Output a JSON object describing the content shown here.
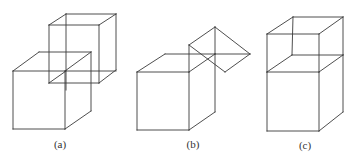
{
  "figure": {
    "stroke_color": "#3a3a3a",
    "panels": [
      {
        "id": "a",
        "label": "(a)",
        "label_pos": [
          60,
          138
        ],
        "description": "Two cubes: a second cube translated diagonally up-right from the first, overlapping",
        "lines": [
          [
            13,
            71,
            65,
            71
          ],
          [
            65,
            71,
            65,
            129
          ],
          [
            65,
            129,
            13,
            129
          ],
          [
            13,
            129,
            13,
            71
          ],
          [
            13,
            71,
            39,
            52
          ],
          [
            39,
            52,
            91,
            52
          ],
          [
            65,
            71,
            91,
            52
          ],
          [
            91,
            52,
            91,
            111
          ],
          [
            65,
            129,
            91,
            111
          ],
          [
            49,
            25,
            99,
            25
          ],
          [
            99,
            25,
            99,
            83
          ],
          [
            99,
            83,
            49,
            83
          ],
          [
            49,
            83,
            49,
            25
          ],
          [
            49,
            25,
            66,
            14
          ],
          [
            66,
            14,
            116,
            14
          ],
          [
            99,
            25,
            116,
            14
          ],
          [
            116,
            14,
            116,
            70
          ],
          [
            99,
            83,
            116,
            70
          ],
          [
            66,
            14,
            66,
            90
          ],
          [
            65,
            71,
            116,
            71
          ],
          [
            49,
            83,
            66,
            71
          ]
        ]
      },
      {
        "id": "b",
        "label": "(b)",
        "label_pos": [
          193,
          138
        ],
        "description": "Cube with a second cube rotated 45° attached at its upper-right edge",
        "lines": [
          [
            137,
            72,
            189,
            72
          ],
          [
            189,
            72,
            189,
            130
          ],
          [
            189,
            130,
            137,
            130
          ],
          [
            137,
            130,
            137,
            72
          ],
          [
            137,
            72,
            165,
            54
          ],
          [
            165,
            54,
            215,
            54
          ],
          [
            189,
            72,
            215,
            54
          ],
          [
            215,
            54,
            215,
            112
          ],
          [
            189,
            130,
            215,
            112
          ],
          [
            215,
            27,
            250,
            54
          ],
          [
            250,
            54,
            225,
            72
          ],
          [
            225,
            72,
            189,
            45
          ],
          [
            189,
            45,
            215,
            27
          ],
          [
            189,
            45,
            189,
            72
          ],
          [
            215,
            27,
            215,
            54
          ],
          [
            215,
            54,
            250,
            54
          ]
        ]
      },
      {
        "id": "c",
        "label": "(c)",
        "label_pos": [
          305,
          139
        ],
        "description": "Two cubes stacked vertically, the second placed directly on top of the first",
        "lines": [
          [
            267,
            72,
            319,
            72
          ],
          [
            319,
            72,
            319,
            131
          ],
          [
            319,
            131,
            267,
            131
          ],
          [
            267,
            131,
            267,
            72
          ],
          [
            267,
            72,
            292,
            55
          ],
          [
            292,
            55,
            343,
            55
          ],
          [
            319,
            72,
            343,
            55
          ],
          [
            343,
            55,
            343,
            112
          ],
          [
            319,
            131,
            343,
            112
          ],
          [
            267,
            34,
            319,
            34
          ],
          [
            319,
            34,
            319,
            72
          ],
          [
            267,
            34,
            267,
            72
          ],
          [
            267,
            34,
            293,
            17
          ],
          [
            293,
            17,
            343,
            17
          ],
          [
            319,
            34,
            343,
            17
          ],
          [
            343,
            17,
            343,
            55
          ],
          [
            293,
            17,
            292,
            55
          ]
        ]
      }
    ]
  }
}
